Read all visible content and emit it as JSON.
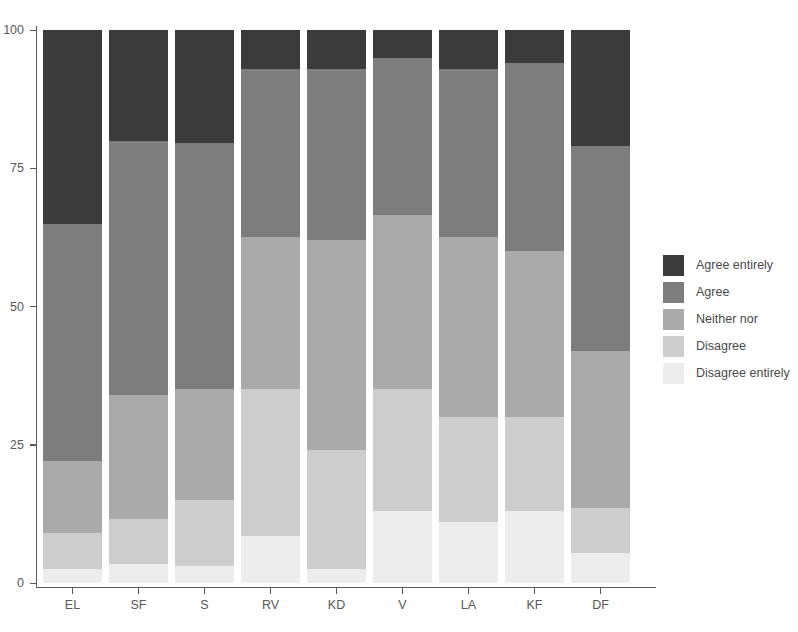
{
  "chart_data": {
    "type": "bar",
    "subtype": "stacked-percent",
    "title": "",
    "xlabel": "",
    "ylabel": "",
    "ylim": [
      0,
      100
    ],
    "yticks": [
      0,
      25,
      50,
      75,
      100
    ],
    "ytick_labels": [
      "0",
      "25",
      "50",
      "75",
      "100"
    ],
    "grid": false,
    "legend_position": "right",
    "categories": [
      "EL",
      "SF",
      "S",
      "RV",
      "KD",
      "V",
      "LA",
      "KF",
      "DF"
    ],
    "series": [
      {
        "name": "Agree entirely",
        "color": "#3b3b3b",
        "values": [
          35,
          20,
          20.5,
          7,
          7,
          5,
          7,
          6,
          21
        ]
      },
      {
        "name": "Agree",
        "color": "#7d7d7d",
        "values": [
          43,
          46,
          44.5,
          30.5,
          31,
          28.5,
          30.5,
          34,
          37
        ]
      },
      {
        "name": "Neither nor",
        "color": "#aaaaaa",
        "values": [
          13,
          22.5,
          20,
          27.5,
          38,
          31.5,
          32.5,
          30,
          28.5
        ]
      },
      {
        "name": "Disagree",
        "color": "#cdcdcd",
        "values": [
          6.5,
          8,
          12,
          26.5,
          21.5,
          22,
          19,
          17,
          8
        ]
      },
      {
        "name": "Disagree entirely",
        "color": "#ededed",
        "values": [
          2.5,
          3.5,
          3,
          8.5,
          2.5,
          13,
          11,
          13,
          5.5
        ]
      }
    ]
  },
  "legend": {
    "items": [
      {
        "label": "Agree entirely",
        "color": "#3b3b3b"
      },
      {
        "label": "Agree",
        "color": "#7d7d7d"
      },
      {
        "label": "Neither nor",
        "color": "#aaaaaa"
      },
      {
        "label": "Disagree",
        "color": "#cdcdcd"
      },
      {
        "label": "Disagree entirely",
        "color": "#ededed"
      }
    ]
  },
  "axis": {
    "y_tick_labels": [
      "100",
      "75",
      "50",
      "25",
      "0"
    ],
    "x_tick_labels": [
      "EL",
      "SF",
      "S",
      "RV",
      "KD",
      "V",
      "LA",
      "KF",
      "DF"
    ]
  }
}
